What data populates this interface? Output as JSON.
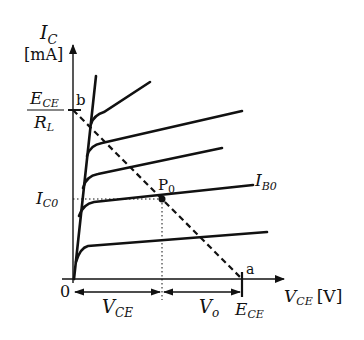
{
  "diagram": {
    "colors": {
      "ink": "#111111",
      "background": "#ffffff"
    },
    "y_axis": {
      "symbol": "I",
      "subscript": "C",
      "unit": "[mA]"
    },
    "x_axis": {
      "symbol": "V",
      "subscript": "CE",
      "unit": "[V]"
    },
    "origin_label": "0",
    "y_intercept": {
      "numerator_symbol": "E",
      "numerator_sub": "CE",
      "denominator_symbol": "R",
      "denominator_sub": "L",
      "point_label": "b"
    },
    "x_intercept": {
      "symbol": "E",
      "subscript": "CE",
      "point_label": "a"
    },
    "operating_point": {
      "symbol": "P",
      "subscript": "0"
    },
    "ic0_label": {
      "symbol": "I",
      "subscript": "C0"
    },
    "curve_label": {
      "symbol": "I",
      "subscript": "B0"
    },
    "dim_vce": {
      "symbol": "V",
      "subscript": "CE"
    },
    "dim_vo": {
      "symbol": "V",
      "subscript": "o"
    },
    "curves_count": 5,
    "load_line_style": "dashed"
  }
}
